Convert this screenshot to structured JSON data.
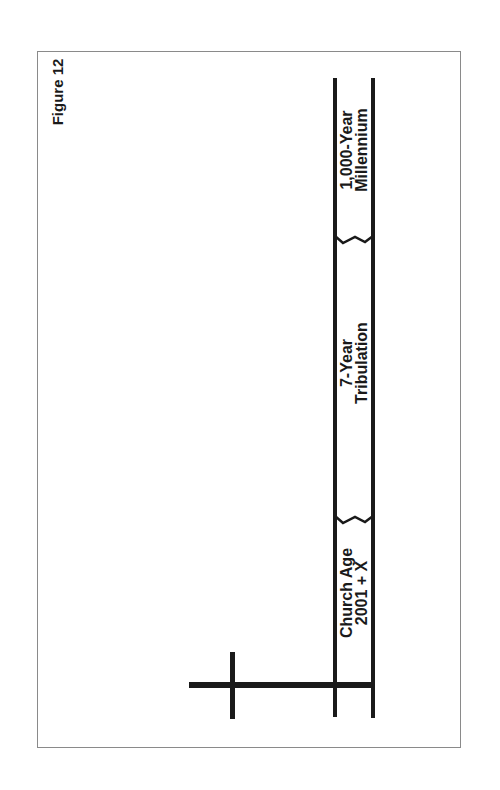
{
  "figure": {
    "label": "Figure 12"
  },
  "timeline": {
    "segments": [
      {
        "line1": "Church Age",
        "line2": "2001 + X"
      },
      {
        "line1": "7-Year",
        "line2": "Tribulation"
      },
      {
        "line1": "1,000-Year",
        "line2": "Millennium"
      }
    ],
    "markers": [
      {
        "type": "cross",
        "meaning": "start of timeline"
      },
      {
        "type": "break",
        "between": "Church Age and 7-Year Tribulation"
      },
      {
        "type": "break",
        "between": "7-Year Tribulation and 1,000-Year Millennium"
      }
    ]
  },
  "colors": {
    "line": "#1a1a1a",
    "frame": "#8a8a8a",
    "background": "#ffffff"
  }
}
